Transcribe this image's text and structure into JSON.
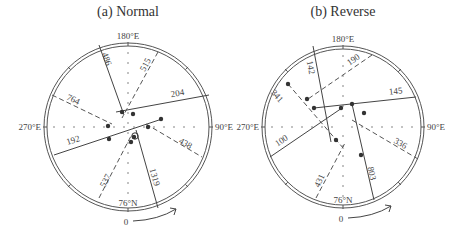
{
  "panels": [
    {
      "title": "(a) Normal",
      "center": [
        128,
        127
      ],
      "radius": 84,
      "axis_labels": {
        "top": "180°E",
        "left": "270°E",
        "right": "90°E",
        "bottom": "76°N",
        "start": "0"
      },
      "solid_lines": [
        {
          "label": "486",
          "x1": 99,
          "y1": 45,
          "x2": 124,
          "y2": 115,
          "lx": 104,
          "ly": 60,
          "rot": 70
        },
        {
          "label": "204",
          "x1": 116,
          "y1": 112,
          "x2": 209,
          "y2": 95,
          "lx": 178,
          "ly": 96,
          "rot": -10
        },
        {
          "label": "192",
          "x1": 54,
          "y1": 155,
          "x2": 162,
          "y2": 119,
          "lx": 74,
          "ly": 143,
          "rot": -18
        },
        {
          "label": "1319",
          "x1": 136,
          "y1": 130,
          "x2": 158,
          "y2": 208,
          "lx": 152,
          "ly": 178,
          "rot": 74
        }
      ],
      "dashed_lines": [
        {
          "label": "515",
          "x1": 158,
          "y1": 52,
          "x2": 122,
          "y2": 118,
          "lx": 148,
          "ly": 66,
          "rot": -62
        },
        {
          "label": "764",
          "x1": 52,
          "y1": 95,
          "x2": 112,
          "y2": 124,
          "lx": 72,
          "ly": 102,
          "rot": 25
        },
        {
          "label": "438",
          "x1": 146,
          "y1": 124,
          "x2": 202,
          "y2": 157,
          "lx": 184,
          "ly": 146,
          "rot": 30
        },
        {
          "label": "537",
          "x1": 99,
          "y1": 198,
          "x2": 131,
          "y2": 136,
          "lx": 108,
          "ly": 182,
          "rot": -62
        }
      ],
      "dots": [
        [
          122,
          112
        ],
        [
          133,
          114
        ],
        [
          108,
          126
        ],
        [
          148,
          127
        ],
        [
          161,
          119
        ],
        [
          109,
          139
        ],
        [
          134,
          137
        ],
        [
          131,
          142
        ]
      ],
      "open_dots": [
        [
          135,
          136
        ]
      ]
    },
    {
      "title": "(b) Reverse",
      "center": [
        343,
        127
      ],
      "radius": 81,
      "axis_labels": {
        "top": "180°E",
        "left": "270°E",
        "right": "90°E",
        "bottom": "76°N",
        "start": "0"
      },
      "solid_lines": [
        {
          "label": "142",
          "x1": 313,
          "y1": 46,
          "x2": 331,
          "y2": 142,
          "lx": 308,
          "ly": 68,
          "rot": 80
        },
        {
          "label": "145",
          "x1": 314,
          "y1": 108,
          "x2": 416,
          "y2": 97,
          "lx": 396,
          "ly": 94,
          "rot": -6
        },
        {
          "label": "100",
          "x1": 270,
          "y1": 157,
          "x2": 342,
          "y2": 108,
          "lx": 283,
          "ly": 143,
          "rot": -34
        },
        {
          "label": "803",
          "x1": 352,
          "y1": 104,
          "x2": 374,
          "y2": 200,
          "lx": 369,
          "ly": 174,
          "rot": 78
        }
      ],
      "dashed_lines": [
        {
          "label": "190",
          "x1": 372,
          "y1": 55,
          "x2": 308,
          "y2": 99,
          "lx": 355,
          "ly": 62,
          "rot": -35
        },
        {
          "label": "341",
          "x1": 288,
          "y1": 84,
          "x2": 344,
          "y2": 149,
          "lx": 275,
          "ly": 98,
          "rot": 48
        },
        {
          "label": "336",
          "x1": 352,
          "y1": 120,
          "x2": 418,
          "y2": 159,
          "lx": 399,
          "ly": 146,
          "rot": 30
        },
        {
          "label": "431",
          "x1": 316,
          "y1": 198,
          "x2": 345,
          "y2": 143,
          "lx": 322,
          "ly": 182,
          "rot": -65
        }
      ],
      "dots": [
        [
          288,
          84
        ],
        [
          307,
          99
        ],
        [
          314,
          108
        ],
        [
          341,
          108
        ],
        [
          352,
          104
        ],
        [
          364,
          113
        ],
        [
          336,
          140
        ],
        [
          361,
          155
        ]
      ],
      "open_dots": []
    }
  ]
}
